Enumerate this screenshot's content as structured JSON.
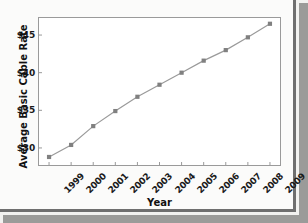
{
  "chart_data": {
    "type": "line",
    "title": "",
    "xlabel": "Year",
    "ylabel": "Average Basic Cable Rate",
    "categories": [
      "1999",
      "2000",
      "2001",
      "2002",
      "2003",
      "2004",
      "2005",
      "2006",
      "2007",
      "2008",
      "2009"
    ],
    "values": [
      28.8,
      30.4,
      32.9,
      34.9,
      36.8,
      38.4,
      40.0,
      41.6,
      43.0,
      44.7,
      46.5
    ],
    "xticklabels": [
      "1999",
      "2000",
      "2001",
      "2002",
      "2003",
      "2004",
      "2005",
      "2006",
      "2007",
      "2008",
      "2009"
    ],
    "yticks": [
      30,
      35,
      40,
      45
    ],
    "yticklabels": [
      "$30",
      "$35",
      "$40",
      "$45"
    ],
    "ylim": [
      27.6,
      47.4
    ],
    "xlim": [
      -0.5,
      10.5
    ],
    "grid": false,
    "legend": false,
    "marker": "square",
    "line_color": "#9a9a9a",
    "marker_color": "#808080",
    "frame_color": "#9a9a9a",
    "plot_background": "#ffffff",
    "page_background": "#fbfbfa"
  }
}
